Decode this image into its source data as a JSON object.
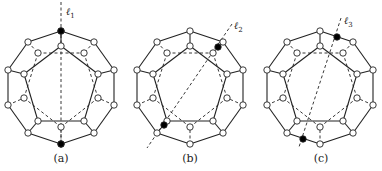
{
  "figure": {
    "colors": {
      "stroke": "#222222",
      "vertex_fill": "#ffffff",
      "highlight_fill": "#000000",
      "background": "#ffffff"
    },
    "panels": [
      {
        "id": "a",
        "caption": "(a)",
        "center": [
          61,
          88
        ],
        "line_label": "ℓ",
        "line_subscript": "1",
        "label_pos": [
          66,
          12
        ],
        "line": [
          [
            61,
            2
          ],
          [
            61,
            146
          ]
        ],
        "highlighted": [
          [
            61,
            31
          ],
          [
            61,
            144
          ]
        ]
      },
      {
        "id": "b",
        "caption": "(b)",
        "center": [
          190,
          88
        ],
        "line_label": "ℓ",
        "line_subscript": "2",
        "label_pos": [
          234,
          26
        ],
        "line": [
          [
            232,
            24
          ],
          [
            147,
            148
          ]
        ],
        "highlighted": [
          [
            218,
            47
          ],
          [
            164,
            125
          ]
        ]
      },
      {
        "id": "c",
        "caption": "(c)",
        "center": [
          320,
          88
        ],
        "line_label": "ℓ",
        "line_subscript": "3",
        "label_pos": [
          344,
          21
        ],
        "line": [
          [
            341,
            18
          ],
          [
            299,
            147
          ]
        ],
        "highlighted": [
          [
            337,
            37
          ],
          [
            303,
            139
          ]
        ]
      }
    ],
    "graph": {
      "outer": [
        [
          0,
          -57
        ],
        [
          33,
          -46
        ],
        [
          53,
          -18
        ],
        [
          53,
          17
        ],
        [
          33,
          45
        ],
        [
          0,
          56
        ],
        [
          -33,
          45
        ],
        [
          -53,
          17
        ],
        [
          -53,
          -18
        ],
        [
          -33,
          -46
        ]
      ],
      "inner_solid": [
        [
          0,
          -42
        ],
        [
          37,
          -14
        ],
        [
          23,
          33
        ],
        [
          -23,
          33
        ],
        [
          -37,
          -14
        ]
      ],
      "inner_dashed": [
        [
          -23,
          -35
        ],
        [
          23,
          -35
        ],
        [
          37,
          10
        ],
        [
          0,
          39
        ],
        [
          -37,
          10
        ]
      ],
      "spokes_solid": [
        [
          0,
          0
        ],
        [
          2,
          1
        ],
        [
          4,
          2
        ],
        [
          6,
          3
        ],
        [
          8,
          4
        ]
      ],
      "spokes_dashed": [
        [
          1,
          1
        ],
        [
          3,
          2
        ],
        [
          5,
          3
        ],
        [
          7,
          4
        ],
        [
          9,
          0
        ]
      ]
    }
  }
}
